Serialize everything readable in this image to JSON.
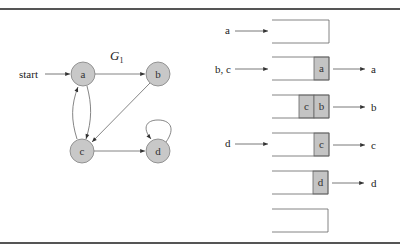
{
  "caption_fragment": "... traversal.",
  "graph": {
    "title": "G",
    "title_subscript": "1",
    "start_label": "start",
    "nodes": [
      {
        "id": "a",
        "label": "a",
        "x": 83,
        "y": 74
      },
      {
        "id": "b",
        "label": "b",
        "x": 158,
        "y": 74
      },
      {
        "id": "c",
        "label": "c",
        "x": 82,
        "y": 151
      },
      {
        "id": "d",
        "label": "d",
        "x": 158,
        "y": 151
      }
    ],
    "edges": [
      {
        "from": "start",
        "to": "a"
      },
      {
        "from": "a",
        "to": "b"
      },
      {
        "from": "a",
        "to": "c"
      },
      {
        "from": "c",
        "to": "a"
      },
      {
        "from": "b",
        "to": "c"
      },
      {
        "from": "c",
        "to": "d"
      },
      {
        "from": "d",
        "to": "d"
      }
    ],
    "node_fill": "#c8c8c8",
    "node_stroke": "#808080"
  },
  "queue_steps": [
    {
      "enqueue": "a",
      "cells": [],
      "dequeue": ""
    },
    {
      "enqueue": "b, c",
      "cells": [
        "a"
      ],
      "dequeue": "a"
    },
    {
      "enqueue": "",
      "cells": [
        "c",
        "b"
      ],
      "dequeue": "b"
    },
    {
      "enqueue": "d",
      "cells": [
        "c"
      ],
      "dequeue": "c"
    },
    {
      "enqueue": "",
      "cells": [
        "d"
      ],
      "dequeue": "d"
    },
    {
      "enqueue": "",
      "cells": [],
      "dequeue": ""
    }
  ],
  "colors": {
    "cell_fill": "#c4c4c4",
    "line": "#555555",
    "rule": "#555555"
  }
}
